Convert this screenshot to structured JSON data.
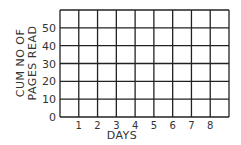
{
  "chart_data": {
    "type": "line",
    "title": "",
    "xlabel": "DAYS",
    "ylabel_lines": [
      "CUM NO OF",
      "PAGES READ"
    ],
    "ylabel": "CUM NO OF PAGES READ",
    "x_ticks": [
      "1",
      "2",
      "3",
      "4",
      "5",
      "6",
      "7",
      "8"
    ],
    "y_ticks": [
      "0",
      "10",
      "20",
      "30",
      "40",
      "50"
    ],
    "xlim": [
      0,
      9
    ],
    "ylim": [
      0,
      60
    ],
    "grid": true,
    "series": [],
    "note": "Empty grid — no data plotted",
    "colors": {
      "grid": "#222222",
      "text": "#333333",
      "background": "#ffffff"
    }
  }
}
